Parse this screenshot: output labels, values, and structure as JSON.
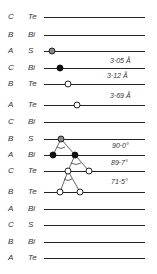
{
  "diagram": {
    "layers": [
      {
        "stacking": "C",
        "element": "Te",
        "y": 17
      },
      {
        "stacking": "B",
        "element": "Bi",
        "y": 35
      },
      {
        "stacking": "A",
        "element": "S",
        "y": 51
      },
      {
        "stacking": "C",
        "element": "Bi",
        "y": 68
      },
      {
        "stacking": "B",
        "element": "Te",
        "y": 84
      },
      {
        "stacking": "A",
        "element": "Te",
        "y": 105
      },
      {
        "stacking": "C",
        "element": "Bi",
        "y": 122
      },
      {
        "stacking": "B",
        "element": "S",
        "y": 139
      },
      {
        "stacking": "A",
        "element": "Bi",
        "y": 155
      },
      {
        "stacking": "C",
        "element": "Te",
        "y": 171
      },
      {
        "stacking": "B",
        "element": "Te",
        "y": 192
      },
      {
        "stacking": "A",
        "element": "Bi",
        "y": 209
      },
      {
        "stacking": "C",
        "element": "S",
        "y": 225
      },
      {
        "stacking": "B",
        "element": "Bi",
        "y": 242
      },
      {
        "stacking": "A",
        "element": "Te",
        "y": 258
      }
    ],
    "distances": [
      {
        "label": "3·05 Å",
        "x": 110,
        "y": 57
      },
      {
        "label": "3·12 Å",
        "x": 107,
        "y": 72
      },
      {
        "label": "3·69 Å",
        "x": 110,
        "y": 92
      }
    ],
    "angles": [
      {
        "label": "90·0°",
        "x": 112,
        "y": 142
      },
      {
        "label": "89·7°",
        "x": 111,
        "y": 159
      },
      {
        "label": "71·5°",
        "x": 111,
        "y": 178
      }
    ]
  }
}
